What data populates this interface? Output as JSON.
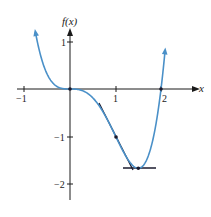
{
  "chart_data": {
    "type": "line",
    "title": "",
    "xlabel": "x",
    "ylabel": "f(x)",
    "function": "f(x) = x^4 - 2x^3",
    "xlim": [
      -1.05,
      2.55
    ],
    "ylim": [
      -2.35,
      1.6
    ],
    "grid": false,
    "legend": null,
    "x_ticks": [
      {
        "value": -1,
        "label": "−1"
      },
      {
        "value": 1,
        "label": "1"
      },
      {
        "value": 2,
        "label": "2"
      }
    ],
    "y_ticks": [
      {
        "value": 1,
        "label": "1"
      },
      {
        "value": -1,
        "label": "−1"
      },
      {
        "value": -2,
        "label": "−2"
      }
    ],
    "series": [
      {
        "name": "f(x)",
        "color": "#4a90c8",
        "x": [
          -0.75,
          -0.5,
          -0.25,
          0,
          0.25,
          0.5,
          0.75,
          1,
          1.25,
          1.5,
          1.75,
          2,
          2.08
        ],
        "values": [
          1.16,
          0.31,
          0.035,
          0,
          -0.027,
          -0.19,
          -0.53,
          -1,
          -1.46,
          -1.69,
          -1.32,
          0,
          0.62
        ]
      }
    ],
    "annotations": [
      {
        "type": "point",
        "x": 0,
        "y": 0,
        "label": "inflection point (horizontal tangent)"
      },
      {
        "type": "point",
        "x": 1,
        "y": -1,
        "label": "inflection point"
      },
      {
        "type": "tangent_line",
        "at_x": 1,
        "slope": -2,
        "x_range": [
          0.62,
          1.38
        ],
        "color": "#1a1a2e"
      },
      {
        "type": "point",
        "x": 1.5,
        "y": -1.6875,
        "label": "local minimum"
      },
      {
        "type": "tangent_line",
        "at_x": 1.5,
        "slope": 0,
        "x_range": [
          1.15,
          1.85
        ],
        "color": "#1a1a2e"
      },
      {
        "type": "point",
        "x": 2,
        "y": 0,
        "label": "x-intercept"
      }
    ]
  },
  "labels": {
    "x_axis": "x",
    "y_axis": "f(x)",
    "tick_x_neg1": "−1",
    "tick_x_1": "1",
    "tick_x_2": "2",
    "tick_y_1": "1",
    "tick_y_neg1": "−1",
    "tick_y_neg2": "−2"
  },
  "colors": {
    "curve": "#4a90c8",
    "axes": "#1a1a1a",
    "tangent": "#1a1a2e"
  }
}
